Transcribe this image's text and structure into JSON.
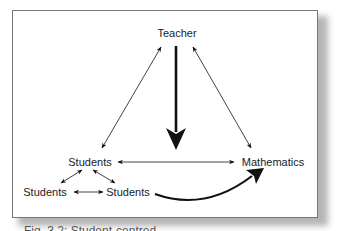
{
  "figure": {
    "nodes": {
      "teacher": "Teacher",
      "students_main": "Students",
      "mathematics": "Mathematics",
      "students_left": "Students",
      "students_right": "Students"
    },
    "edges": [
      {
        "from": "teacher",
        "to": "students_main",
        "type": "bidirectional"
      },
      {
        "from": "teacher",
        "to": "mathematics",
        "type": "bidirectional"
      },
      {
        "from": "students_main",
        "to": "mathematics",
        "type": "bidirectional"
      },
      {
        "from": "teacher",
        "to": "center",
        "type": "bold-directed"
      },
      {
        "from": "students_main",
        "to": "students_left",
        "type": "bidirectional"
      },
      {
        "from": "students_main",
        "to": "students_right",
        "type": "bidirectional"
      },
      {
        "from": "students_left",
        "to": "students_right",
        "type": "bidirectional"
      },
      {
        "from": "students_right",
        "to": "mathematics",
        "type": "bold-curved-directed"
      }
    ],
    "caption": "Fig. 3.2: Student-centred..."
  },
  "colors": {
    "ink": "#111111",
    "frame": "#777777",
    "shadow": "#b5b5b5"
  }
}
